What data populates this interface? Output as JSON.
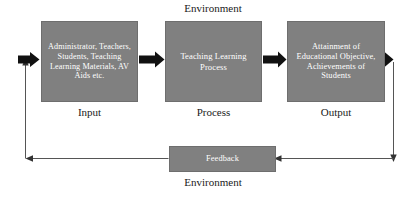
{
  "diagram": {
    "title_top": "Environment",
    "title_bottom": "Environment",
    "nodes": [
      {
        "id": "input",
        "text": "Administrator, Teachers, Students, Teaching Learning Materials, AV Aids etc.",
        "caption": "Input"
      },
      {
        "id": "process",
        "text": "Teaching Learning Process",
        "caption": "Process"
      },
      {
        "id": "output",
        "text": "Attainment of Educational Objective, Achievements of Students",
        "caption": "Output"
      }
    ],
    "feedback": {
      "id": "feedback",
      "text": "Feedback"
    },
    "connectors": [
      {
        "name": "loop-into-input",
        "from": "feedback-loop",
        "to": "input",
        "style": "thick-arrow"
      },
      {
        "name": "input-to-process",
        "from": "input",
        "to": "process",
        "style": "thick-arrow"
      },
      {
        "name": "process-to-output",
        "from": "process",
        "to": "output",
        "style": "thick-arrow"
      },
      {
        "name": "output-to-loop",
        "from": "output",
        "to": "feedback-loop",
        "style": "thick-arrow"
      },
      {
        "name": "output-down-line",
        "from": "output",
        "to": "feedback",
        "style": "thin-line"
      },
      {
        "name": "feedback-to-left-line",
        "from": "feedback",
        "to": "input-loop",
        "style": "thin-line"
      }
    ],
    "colors": {
      "box_fill": "#808080",
      "box_text": "#ffffff",
      "caption_text": "#1a1a1a",
      "arrow_thick": "#111111",
      "line_thin": "#555555",
      "background": "#ffffff"
    }
  }
}
